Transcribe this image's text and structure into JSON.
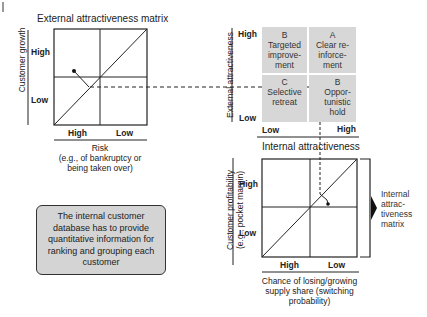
{
  "external_matrix": {
    "title": "External attractiveness matrix",
    "y_axis_label": "Customer growth",
    "y_ticks": [
      "High",
      "Low"
    ],
    "x_ticks": [
      "High",
      "Low"
    ],
    "x_axis_label_line1": "Risk",
    "x_axis_label_line2": "(e.g., of bankruptcy or",
    "x_axis_label_line3": "being taken over)"
  },
  "portfolio_matrix": {
    "y_axis_label": "External attractiveness",
    "y_ticks": [
      "High",
      "Low"
    ],
    "x_ticks": [
      "Low",
      "High"
    ],
    "x_axis_label": "Internal attractiveness",
    "quadrants": [
      {
        "grade": "B",
        "line1": "Targeted",
        "line2": "improve-",
        "line3": "ment"
      },
      {
        "grade": "A",
        "line1": "Clear re-",
        "line2": "inforce-",
        "line3": "ment"
      },
      {
        "grade": "C",
        "line1": "Selective",
        "line2": "retreat",
        "line3": ""
      },
      {
        "grade": "B",
        "line1": "Oppor-",
        "line2": "tunistic",
        "line3": "hold"
      }
    ],
    "quadrant_color": "#d7d7d7"
  },
  "internal_matrix": {
    "y_axis_label_line1": "Customer profitability",
    "y_axis_label_line2": "(e.g., pocket margin)",
    "y_ticks": [
      "High",
      "Low"
    ],
    "x_ticks": [
      "High",
      "Low"
    ],
    "x_axis_label_line1": "Chance of losing/growing",
    "x_axis_label_line2": "supply share (switching",
    "x_axis_label_line3": "probability)",
    "side_label_line1": "Internal",
    "side_label_line2": "attrac-",
    "side_label_line3": "tiveness",
    "side_label_line4": "matrix"
  },
  "note": {
    "text": "The internal customer database has to provide quantitative information for ranking and grouping each customer",
    "background": "#d4d4d4"
  }
}
